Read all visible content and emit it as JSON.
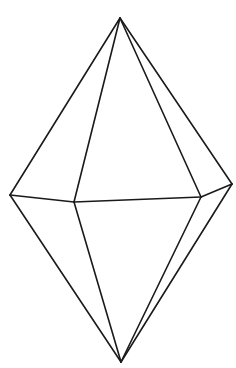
{
  "figure": {
    "stroke_color": "#1a1a1a",
    "background": "#ffffff",
    "vertices": {
      "top": [
        120,
        18
      ],
      "left": [
        10,
        195
      ],
      "front_left": [
        74,
        202
      ],
      "front_right": [
        201,
        197
      ],
      "right": [
        232,
        184
      ],
      "bottom": [
        121,
        362
      ]
    },
    "edges": [
      [
        "top",
        "left"
      ],
      [
        "top",
        "front_left"
      ],
      [
        "top",
        "front_right"
      ],
      [
        "top",
        "right"
      ],
      [
        "left",
        "front_left"
      ],
      [
        "front_left",
        "front_right"
      ],
      [
        "front_right",
        "right"
      ],
      [
        "left",
        "bottom"
      ],
      [
        "front_left",
        "bottom"
      ],
      [
        "front_right",
        "bottom"
      ],
      [
        "right",
        "bottom"
      ]
    ]
  }
}
